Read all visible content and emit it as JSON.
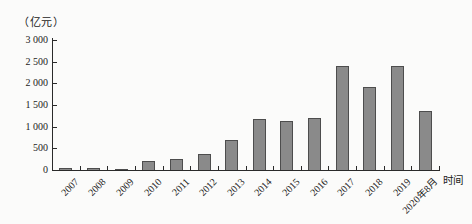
{
  "figure": {
    "background": "#fbfbfa",
    "axis_color": "#2a2a2a",
    "text_color": "#1b1b1b"
  },
  "chart_data": {
    "type": "bar",
    "title": "",
    "unit_label": "（亿元）",
    "xlabel": "时间",
    "ylabel": "（亿元）",
    "categories": [
      "2007",
      "2008",
      "2009",
      "2010",
      "2011",
      "2012",
      "2013",
      "2014",
      "2015",
      "2016",
      "2017",
      "2018",
      "2019",
      "2020年8月"
    ],
    "values": [
      50,
      50,
      20,
      200,
      250,
      370,
      700,
      1180,
      1130,
      1210,
      2400,
      1910,
      2400,
      1350
    ],
    "ylim": [
      0,
      3000
    ],
    "yticks": [
      0,
      500,
      1000,
      1500,
      2000,
      2500,
      3000
    ],
    "ytick_labels": [
      "0",
      "500",
      "1 000",
      "1 500",
      "2 000",
      "2 500",
      "3 000"
    ],
    "grid": false,
    "legend": null,
    "bar_color": "#8a8a8a",
    "bar_border_color": "#4d4d4d"
  }
}
